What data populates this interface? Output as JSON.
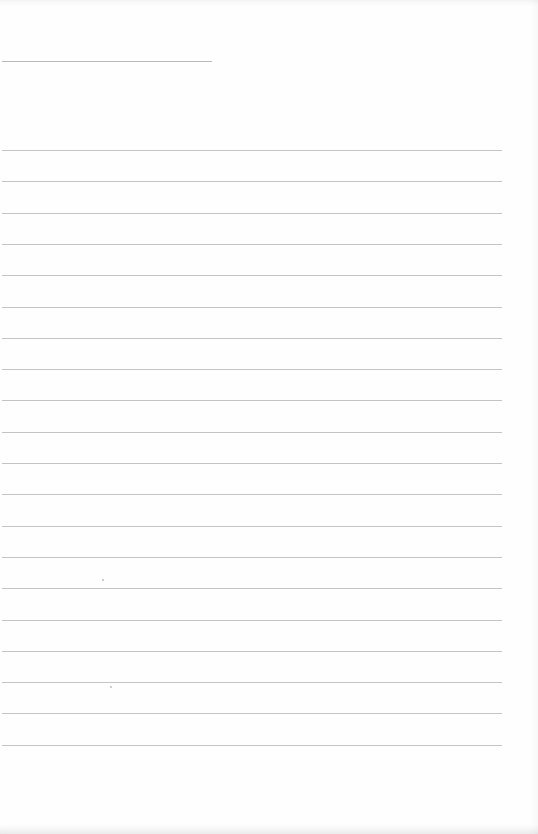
{
  "page": {
    "type": "blank lined paper",
    "background_color": "#fefefe",
    "line_color": "#c4c4c4",
    "header_line": {
      "x": 2,
      "y": 61,
      "width": 210
    },
    "ruled_lines": {
      "count": 20,
      "first_y": 150,
      "spacing": 31.3,
      "x": 2,
      "width": 500
    }
  }
}
